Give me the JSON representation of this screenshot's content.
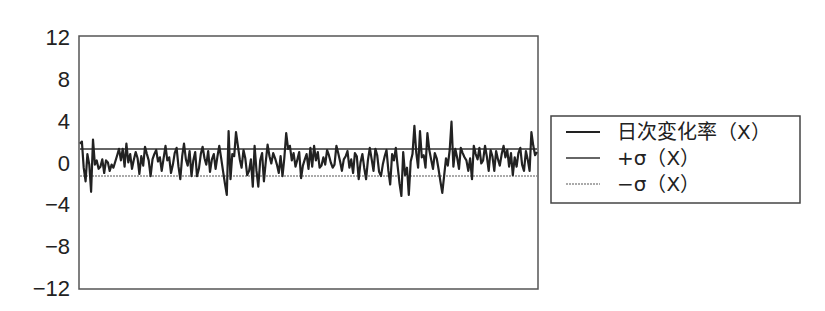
{
  "chart_data": {
    "type": "line",
    "title": "",
    "xlabel": "",
    "ylabel": "",
    "ylim": [
      -12,
      12
    ],
    "yticks": [
      12,
      8,
      4,
      0,
      -4,
      -8,
      -12
    ],
    "ytick_labels": [
      "12",
      "8",
      "4",
      "0",
      "−4",
      "−8",
      "−12"
    ],
    "grid": false,
    "legend_position": "right",
    "series": [
      {
        "name": "日次変化率（X）",
        "color": "#222222",
        "values": [
          1.8,
          2.0,
          -0.5,
          -1.8,
          0.8,
          -0.2,
          -2.8,
          2.2,
          -0.2,
          0.2,
          -0.6,
          -0.4,
          0.3,
          -1.0,
          0.2,
          0.0,
          -0.8,
          -0.2,
          -0.5,
          0.1,
          0.7,
          1.3,
          0.2,
          1.3,
          -0.4,
          1.8,
          0.0,
          0.8,
          -0.6,
          0.3,
          1.0,
          0.4,
          -1.1,
          0.6,
          -0.3,
          1.5,
          0.8,
          0.2,
          -1.3,
          0.3,
          0.8,
          1.2,
          0.1,
          0.5,
          -0.8,
          0.4,
          1.6,
          0.2,
          0.5,
          -1.0,
          -0.2,
          0.9,
          1.4,
          -0.4,
          -1.6,
          0.6,
          1.8,
          0.3,
          -0.3,
          1.1,
          -1.3,
          0.2,
          1.0,
          -1.3,
          -0.6,
          0.8,
          1.5,
          0.4,
          -0.2,
          1.1,
          -0.9,
          0.3,
          0.8,
          -0.6,
          0.6,
          1.6,
          0.4,
          -0.8,
          -2.0,
          -3.1,
          3.0,
          -1.6,
          0.8,
          0.6,
          2.9,
          1.6,
          0.3,
          -0.5,
          1.2,
          0.4,
          -1.2,
          -0.8,
          0.3,
          -2.3,
          1.6,
          -0.8,
          -2.3,
          0.2,
          0.9,
          -1.8,
          0.1,
          1.7,
          0.6,
          -0.1,
          0.9,
          0.4,
          -0.2,
          -1.0,
          0.6,
          -1.3,
          0.4,
          2.8,
          1.3,
          1.6,
          0.2,
          0.9,
          -0.4,
          0.3,
          1.0,
          -1.5,
          -0.3,
          0.3,
          0.8,
          -0.6,
          1.4,
          -0.4,
          1.6,
          0.2,
          1.0,
          -0.5,
          -0.3,
          0.5,
          -0.2,
          1.2,
          0.7,
          0.0,
          -0.5,
          -0.2,
          1.6,
          0.9,
          0.1,
          -0.8,
          0.3,
          0.6,
          1.1,
          -0.5,
          0.3,
          -1.0,
          0.9,
          0.6,
          -1.6,
          0.0,
          0.8,
          -0.5,
          -1.6,
          0.2,
          1.4,
          0.3,
          -0.8,
          1.3,
          0.7,
          -0.9,
          -1.3,
          -0.2,
          0.6,
          1.2,
          -0.8,
          -2.1,
          0.8,
          0.2,
          1.4,
          -0.4,
          -2.0,
          -3.2,
          1.0,
          -1.2,
          -0.5,
          -3.1,
          0.1,
          0.8,
          3.5,
          1.0,
          -0.5,
          3.0,
          0.5,
          0.7,
          -0.5,
          2.8,
          1.2,
          0.3,
          -0.6,
          0.9,
          0.4,
          -0.6,
          -1.8,
          -2.9,
          -1.3,
          0.4,
          -0.3,
          1.2,
          3.9,
          -0.4,
          1.3,
          0.5,
          -0.6,
          1.4,
          0.9,
          0.5,
          0.2,
          -0.8,
          0.4,
          -1.6,
          1.6,
          0.8,
          0.3,
          1.4,
          -0.1,
          0.2,
          1.6,
          0.6,
          -0.8,
          1.2,
          0.6,
          -0.8,
          1.1,
          0.3,
          -0.3,
          0.8,
          1.6,
          0.5,
          1.2,
          -0.4,
          0.9,
          -1.2,
          0.5,
          -0.4,
          0.9,
          1.4,
          -0.2,
          -0.8,
          1.1,
          0.3,
          -0.8,
          2.9,
          1.6,
          0.7,
          1.0
        ]
      },
      {
        "name": "+σ（X）",
        "color": "#666666",
        "constant": 1.3
      },
      {
        "name": "−σ（X）",
        "color": "#aaaaaa",
        "constant": -1.3
      }
    ]
  },
  "legend": {
    "items": [
      {
        "label": "日次変化率（X）",
        "color": "#222222",
        "stroke_width": 2.2,
        "dash": ""
      },
      {
        "label": "+σ（X）",
        "color": "#666666",
        "stroke_width": 2.0,
        "dash": ""
      },
      {
        "label": "−σ（X）",
        "color": "#aaaaaa",
        "stroke_width": 2.0,
        "dash": "2,1"
      }
    ]
  }
}
